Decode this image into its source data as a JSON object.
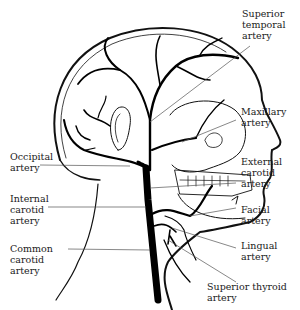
{
  "diagram": {
    "type": "anatomical-illustration",
    "labels": {
      "superior_temporal": [
        "Superior",
        "temporal",
        "artery"
      ],
      "maxillary": [
        "Maxillary",
        "artery"
      ],
      "external_carotid": [
        "External",
        "carotid",
        "artery"
      ],
      "facial": [
        "Facial",
        "artery"
      ],
      "lingual": [
        "Lingual",
        "artery"
      ],
      "superior_thyroid": [
        "Superior thyroid",
        "artery"
      ],
      "occipital": [
        "Occipital",
        "artery"
      ],
      "internal_carotid": [
        "Internal",
        "carotid",
        "artery"
      ],
      "common_carotid": [
        "Common",
        "carotid",
        "artery"
      ]
    },
    "colors": {
      "ink": "#111111",
      "background": "#ffffff",
      "leader": "#555555"
    }
  }
}
